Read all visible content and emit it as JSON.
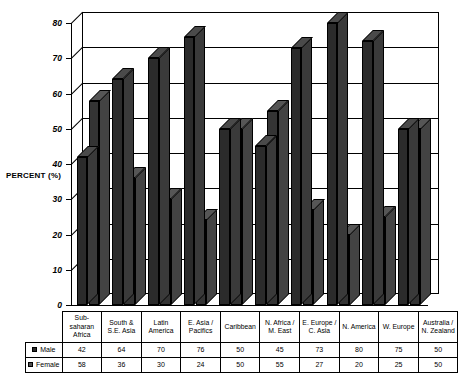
{
  "chart_data": {
    "type": "bar",
    "title": "",
    "xlabel": "",
    "ylabel": "PERCENT (%)",
    "ylim": [
      0,
      80
    ],
    "yticks": [
      0,
      10,
      20,
      30,
      40,
      50,
      60,
      70,
      80
    ],
    "grid": true,
    "legend_position": "table-left",
    "categories": [
      "Sub-saharan Africa",
      "South & S.E. Asia",
      "Latin America",
      "E. Asia / Pacifics",
      "Caribbean",
      "N. Africa / M. East",
      "E. Europe / C. Asia",
      "N. America",
      "W. Europe",
      "Australia / N. Zealand"
    ],
    "category_lines": [
      [
        "Sub-",
        "saharan",
        "Africa"
      ],
      [
        "South &",
        "S.E. Asia"
      ],
      [
        "Latin",
        "America"
      ],
      [
        "E. Asia /",
        "Pacifics"
      ],
      [
        "Caribbean"
      ],
      [
        "N. Africa /",
        "M. East"
      ],
      [
        "E. Europe /",
        "C. Asia"
      ],
      [
        "N. America"
      ],
      [
        "W. Europe"
      ],
      [
        "Australia /",
        "N. Zealand"
      ]
    ],
    "series": [
      {
        "name": "Male",
        "color": "#2b2b2b",
        "values": [
          42,
          64,
          70,
          76,
          50,
          45,
          73,
          80,
          75,
          50
        ]
      },
      {
        "name": "Female",
        "color": "#4f4f4f",
        "values": [
          58,
          36,
          30,
          24,
          50,
          55,
          27,
          20,
          25,
          50
        ]
      }
    ]
  },
  "axis": {
    "title": "PERCENT (%)"
  }
}
